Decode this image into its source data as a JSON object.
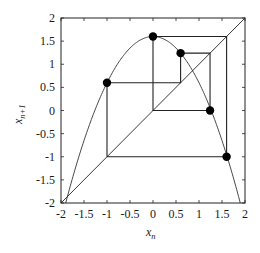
{
  "chart_data": {
    "type": "line",
    "title": "",
    "xlabel": "x_n",
    "ylabel": "x_{n+1}",
    "xlim": [
      -2,
      2
    ],
    "ylim": [
      -2,
      2
    ],
    "grid": false,
    "legend": null,
    "x_ticks": [
      "-2",
      "-1.5",
      "-1",
      "-0.5",
      "0",
      "0.5",
      "1",
      "1.5",
      "2"
    ],
    "y_ticks": [
      "-2",
      "-1.5",
      "-1",
      "-0.5",
      "0",
      "0.5",
      "1",
      "1.5",
      "2"
    ],
    "series": [
      {
        "name": "map",
        "style": "curve",
        "formula": "x_{n+1} = 1.6 - x_n^2",
        "x": [
          -1.887,
          -1.5,
          -1.0,
          -0.5,
          0.0,
          0.5,
          1.0,
          1.5,
          1.887
        ],
        "y": [
          -1.96,
          -0.65,
          0.6,
          1.35,
          1.6,
          1.35,
          0.6,
          -0.65,
          -1.96
        ]
      },
      {
        "name": "identity",
        "style": "line",
        "x": [
          -2,
          2
        ],
        "y": [
          -2,
          2
        ]
      },
      {
        "name": "cobweb",
        "style": "polyline",
        "x": [
          -1,
          -1,
          0.6,
          0.6,
          1.24,
          1.24,
          0,
          0,
          1.6,
          1.6,
          -1
        ],
        "y": [
          -1,
          0.6,
          0.6,
          1.24,
          1.24,
          0,
          0,
          1.6,
          1.6,
          -1,
          -1
        ]
      },
      {
        "name": "orbit points",
        "style": "markers",
        "x": [
          -1,
          0,
          0.6,
          1.24,
          1.6
        ],
        "y": [
          0.6,
          1.6,
          1.24,
          0,
          -1
        ]
      }
    ]
  },
  "labels": {
    "x_main": "x",
    "x_sub": "n",
    "y_main": "x",
    "y_sub": "n+1"
  }
}
